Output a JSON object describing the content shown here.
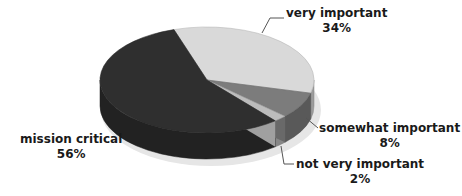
{
  "chart_data": {
    "type": "pie",
    "style": "3d",
    "title": "",
    "categories": [
      "very important",
      "somewhat important",
      "not very important",
      "mission critical"
    ],
    "values": [
      34,
      8,
      2,
      56
    ],
    "unit": "%",
    "labels": [
      {
        "name": "very important",
        "pct": "34%"
      },
      {
        "name": "somewhat important",
        "pct": "8%"
      },
      {
        "name": "not very important",
        "pct": "2%"
      },
      {
        "name": "mission critical",
        "pct": "56%"
      }
    ],
    "colors": {
      "very important": "#d9d9d9",
      "somewhat important": "#7c7c7c",
      "not very important": "#bcbcbc",
      "mission critical": "#2f2f2f"
    },
    "legend": "none (data labels with leader lines)"
  }
}
